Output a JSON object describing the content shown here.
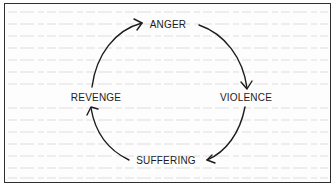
{
  "diagram": {
    "title": "",
    "type": "cycle",
    "nodes": [
      {
        "id": "anger",
        "label": "ANGER",
        "x": 168,
        "y": 25
      },
      {
        "id": "violence",
        "label": "VIOLENCE",
        "x": 246,
        "y": 98
      },
      {
        "id": "suffering",
        "label": "SUFFERING",
        "x": 166,
        "y": 161
      },
      {
        "id": "revenge",
        "label": "REVENGE",
        "x": 96,
        "y": 98
      }
    ],
    "edges": [
      {
        "from": "revenge",
        "to": "anger",
        "direction": "clockwise"
      },
      {
        "from": "anger",
        "to": "violence",
        "direction": "clockwise"
      },
      {
        "from": "violence",
        "to": "suffering",
        "direction": "clockwise"
      },
      {
        "from": "suffering",
        "to": "revenge",
        "direction": "clockwise"
      }
    ]
  },
  "colors": {
    "ink": "#1c1c1c",
    "border": "#2f2f2f",
    "background": "#ffffff",
    "bleed_through": "#ececec"
  }
}
